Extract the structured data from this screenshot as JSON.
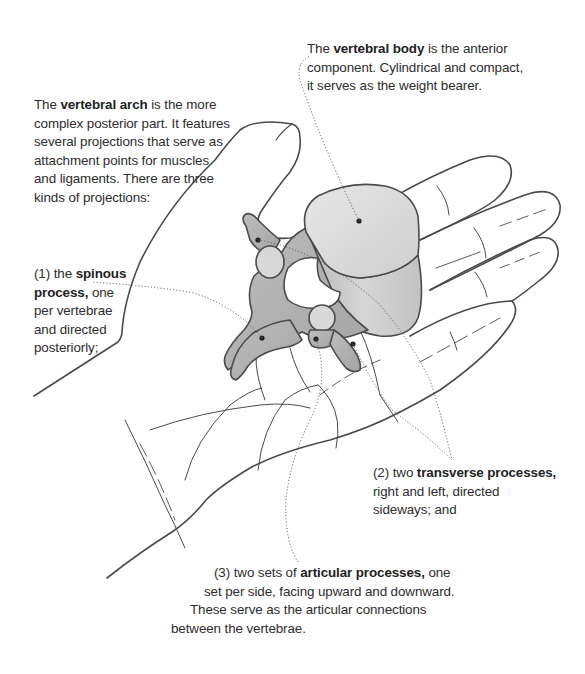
{
  "diagram": {
    "colors": {
      "outline": "#4a4a4a",
      "bone_light": "#dcdcdc",
      "bone_mid": "#c4c4c4",
      "bone_dark": "#a9a9a9",
      "leader_line": "#666666",
      "text": "#2d2d2d"
    }
  },
  "labels": {
    "vertebral_body": {
      "lines": [
        {
          "pre": "The ",
          "bold": "vertebral body",
          "post": " is the anterior"
        },
        {
          "pre": "component. Cylindrical and compact,",
          "bold": "",
          "post": ""
        },
        {
          "pre": "it serves as the weight bearer.",
          "bold": "",
          "post": ""
        }
      ]
    },
    "vertebral_arch": {
      "lines": [
        {
          "pre": "The ",
          "bold": "vertebral arch",
          "post": " is the more"
        },
        {
          "pre": "complex posterior part. It features",
          "bold": "",
          "post": ""
        },
        {
          "pre": "several projections that serve as",
          "bold": "",
          "post": ""
        },
        {
          "pre": "attachment points for muscles",
          "bold": "",
          "post": ""
        },
        {
          "pre": "and ligaments. There are three",
          "bold": "",
          "post": ""
        },
        {
          "pre": "kinds of projections:",
          "bold": "",
          "post": ""
        }
      ]
    },
    "spinous_process": {
      "lines": [
        {
          "pre": "(1) the ",
          "bold": "spinous",
          "post": ""
        },
        {
          "pre": "",
          "bold": "process,",
          "post": " one"
        },
        {
          "pre": "per vertebrae",
          "bold": "",
          "post": ""
        },
        {
          "pre": "and directed",
          "bold": "",
          "post": ""
        },
        {
          "pre": "posteriorly;",
          "bold": "",
          "post": ""
        }
      ]
    },
    "transverse_processes": {
      "lines": [
        {
          "pre": "(2) two ",
          "bold": "transverse processes,",
          "post": ""
        },
        {
          "pre": "right and left, directed",
          "bold": "",
          "post": ""
        },
        {
          "pre": "sideways; and",
          "bold": "",
          "post": ""
        }
      ]
    },
    "articular_processes": {
      "lines": [
        {
          "pre": "(3) two sets of ",
          "bold": "articular processes,",
          "post": " one"
        },
        {
          "pre": "set per side, facing upward and downward.",
          "bold": "",
          "post": ""
        },
        {
          "pre": "These serve as the articular connections",
          "bold": "",
          "post": ""
        },
        {
          "pre": "between the vertebrae.",
          "bold": "",
          "post": ""
        }
      ]
    }
  }
}
